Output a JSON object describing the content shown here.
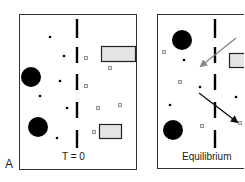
{
  "figure": {
    "panel_label": "A",
    "panels": [
      {
        "id": "left",
        "caption": "T = 0",
        "large_particles": [
          {
            "cx": 31,
            "cy": 77
          },
          {
            "cx": 38,
            "cy": 127
          }
        ],
        "small_dots": [
          {
            "cx": 50,
            "cy": 37
          },
          {
            "cx": 64,
            "cy": 56
          },
          {
            "cx": 60,
            "cy": 81
          },
          {
            "cx": 40,
            "cy": 96
          },
          {
            "cx": 67,
            "cy": 108
          },
          {
            "cx": 57,
            "cy": 138
          }
        ],
        "small_squares": [
          {
            "x": 86,
            "y": 58
          },
          {
            "x": 110,
            "y": 68
          },
          {
            "x": 86,
            "y": 86
          },
          {
            "x": 98,
            "y": 108
          },
          {
            "x": 120,
            "y": 105
          },
          {
            "x": 94,
            "y": 132
          }
        ],
        "rectangles": [
          {
            "x": 101,
            "y": 46,
            "w": 35,
            "h": 16
          },
          {
            "x": 99,
            "y": 124,
            "w": 22,
            "h": 14
          }
        ]
      },
      {
        "id": "right",
        "caption": "Equilibrium",
        "large_particles": [
          {
            "cx": 182,
            "cy": 40
          },
          {
            "cx": 173,
            "cy": 130
          }
        ],
        "small_dots": [
          {
            "cx": 184,
            "cy": 60
          },
          {
            "cx": 200,
            "cy": 87
          },
          {
            "cx": 170,
            "cy": 105
          },
          {
            "cx": 236,
            "cy": 97
          }
        ],
        "small_squares": [
          {
            "x": 164,
            "y": 52
          },
          {
            "x": 180,
            "y": 82
          },
          {
            "x": 202,
            "y": 126
          },
          {
            "x": 240,
            "y": 123
          }
        ],
        "rectangles": [
          {
            "x": 229,
            "y": 53,
            "w": 16,
            "h": 15
          }
        ],
        "arrows": [
          {
            "name": "gray-arrow",
            "color": "#8a8a8a",
            "x1": 236,
            "y1": 38,
            "x2": 201,
            "y2": 66
          },
          {
            "name": "black-arrow",
            "color": "#111111",
            "x1": 199,
            "y1": 93,
            "x2": 237,
            "y2": 122
          }
        ]
      }
    ],
    "colors": {
      "border": "#333333",
      "particle": "#000000",
      "square_fill": "#e6e6e6",
      "square_stroke": "#8c8c8c",
      "rect_fill": "#e4e4e4",
      "rect_stroke": "#222222",
      "membrane": "#000000"
    }
  }
}
